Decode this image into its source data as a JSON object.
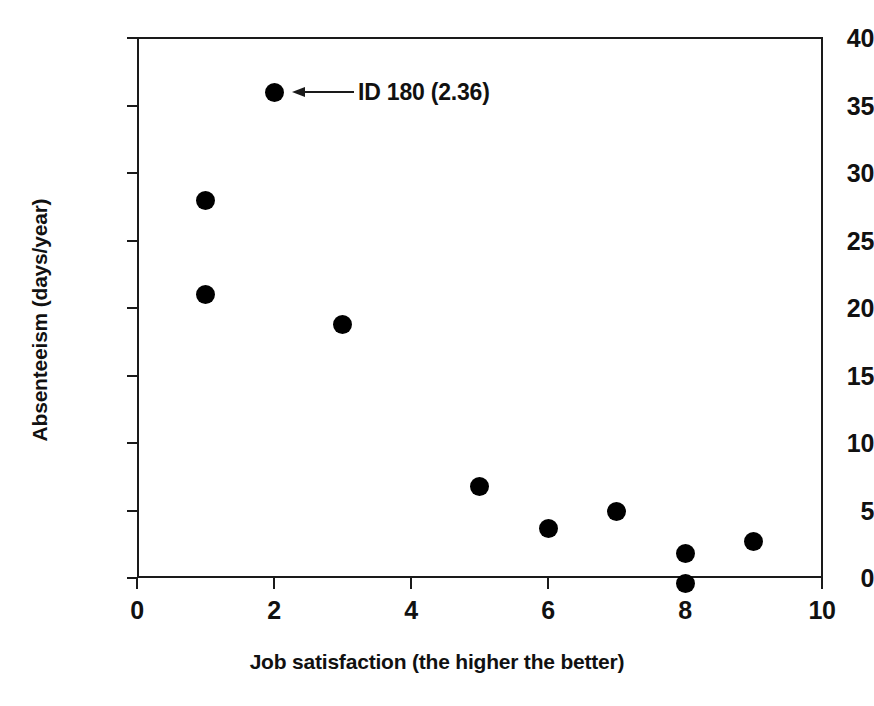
{
  "chart_data": {
    "type": "scatter",
    "title": "",
    "xlabel": "Job satisfaction (the higher the better)",
    "ylabel": "Absenteeism (days/year)",
    "xlim": [
      0,
      10
    ],
    "ylim": [
      0,
      40
    ],
    "grid": false,
    "legend": null,
    "xticks": [
      "0",
      "2",
      "4",
      "6",
      "8",
      "10"
    ],
    "xtick_values": [
      0,
      2,
      4,
      6,
      8,
      10
    ],
    "yticks": [
      "0",
      "5",
      "10",
      "15",
      "20",
      "25",
      "30",
      "35",
      "40"
    ],
    "ytick_values": [
      0,
      5,
      10,
      15,
      20,
      25,
      30,
      35,
      40
    ],
    "x": [
      1,
      1,
      2,
      3,
      5,
      6,
      7,
      8,
      8,
      9
    ],
    "y": [
      28.0,
      21.0,
      36.0,
      18.8,
      6.8,
      3.7,
      4.9,
      1.8,
      -0.4,
      2.7
    ],
    "points": [
      {
        "x": 1,
        "y": 28.0
      },
      {
        "x": 1,
        "y": 21.0
      },
      {
        "x": 2,
        "y": 36.0
      },
      {
        "x": 3,
        "y": 18.8
      },
      {
        "x": 5,
        "y": 6.8
      },
      {
        "x": 6,
        "y": 3.7
      },
      {
        "x": 7,
        "y": 4.9
      },
      {
        "x": 8,
        "y": 1.8
      },
      {
        "x": 8,
        "y": -0.4
      },
      {
        "x": 9,
        "y": 2.7
      }
    ],
    "marker_color": "#000000",
    "axis_color": "#1a1a1a",
    "annotations": [
      {
        "text": "ID 180 (2.36)",
        "target_x": 2,
        "target_y": 36.0,
        "arrow": "left-pointing-arrow"
      }
    ]
  }
}
